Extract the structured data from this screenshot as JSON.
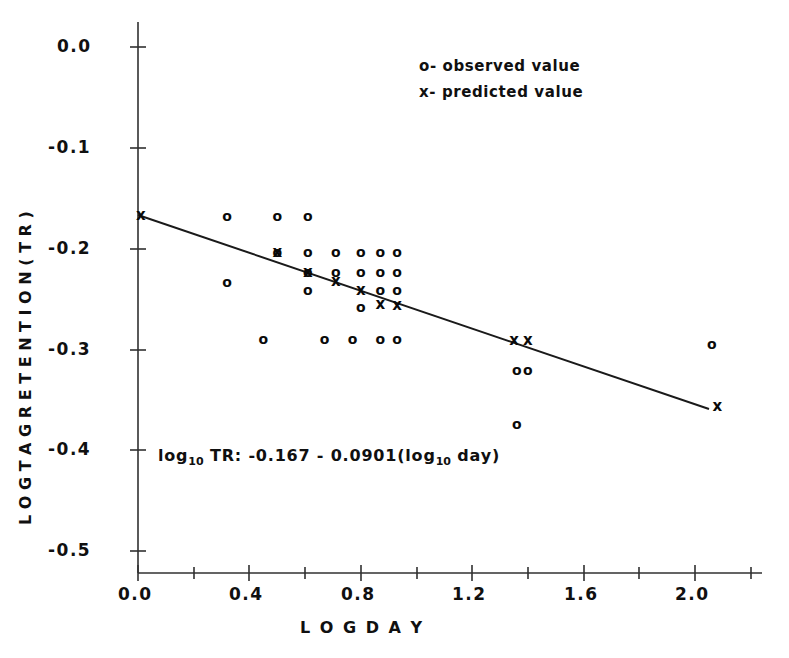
{
  "figure": {
    "width": 789,
    "height": 658,
    "background": "#ffffff",
    "ink_color": "#101010"
  },
  "axes": {
    "x_title": "L O G   D A Y",
    "y_title": "L O G  T A G  R E T E N T I O N ( T R )",
    "x_tick_labels": [
      "0.0",
      "0.4",
      "0.8",
      "1.2",
      "1.6",
      "2.0"
    ],
    "y_tick_labels": [
      "0.0",
      "-0.1",
      "-0.2",
      "-0.3",
      "-0.4",
      "-0.5"
    ]
  },
  "legend": {
    "observed": "o- observed  value",
    "predicted": "x- predicted  value"
  },
  "annotation": {
    "equation_prefix": "log",
    "equation_sub1": "10",
    "equation_mid": " TR: -0.167 - 0.0901(log",
    "equation_sub2": "10",
    "equation_suffix": " day)"
  },
  "chart_data": {
    "type": "scatter",
    "title": "",
    "xlabel": "LOG DAY",
    "ylabel": "LOG TAG RETENTION (TR)",
    "xlim": [
      0.0,
      2.2
    ],
    "ylim": [
      -0.5,
      0.0
    ],
    "xticks": [
      0.0,
      0.4,
      0.8,
      1.2,
      1.6,
      2.0
    ],
    "xticks_minor": [
      0.2,
      0.6,
      1.0,
      1.4,
      1.8,
      2.2
    ],
    "yticks": [
      0.0,
      -0.1,
      -0.2,
      -0.3,
      -0.4,
      -0.5
    ],
    "grid": false,
    "legend_position": "top-right",
    "regression": {
      "equation": "log10 TR = -0.167 - 0.0901 (log10 day)",
      "intercept": -0.167,
      "slope": -0.0901,
      "x_start": 0.0,
      "x_end": 2.08
    },
    "series": [
      {
        "name": "observed value",
        "marker": "o",
        "points": [
          [
            0.32,
            -0.168
          ],
          [
            0.5,
            -0.168
          ],
          [
            0.61,
            -0.168
          ],
          [
            0.5,
            -0.203
          ],
          [
            0.61,
            -0.203
          ],
          [
            0.71,
            -0.203
          ],
          [
            0.8,
            -0.203
          ],
          [
            0.87,
            -0.203
          ],
          [
            0.93,
            -0.203
          ],
          [
            0.61,
            -0.223
          ],
          [
            0.71,
            -0.223
          ],
          [
            0.8,
            -0.223
          ],
          [
            0.87,
            -0.223
          ],
          [
            0.93,
            -0.223
          ],
          [
            0.32,
            -0.233
          ],
          [
            0.61,
            -0.241
          ],
          [
            0.87,
            -0.241
          ],
          [
            0.93,
            -0.241
          ],
          [
            0.8,
            -0.258
          ],
          [
            0.45,
            -0.29
          ],
          [
            0.67,
            -0.29
          ],
          [
            0.77,
            -0.29
          ],
          [
            0.87,
            -0.29
          ],
          [
            0.93,
            -0.29
          ],
          [
            1.36,
            -0.32
          ],
          [
            1.4,
            -0.32
          ],
          [
            1.36,
            -0.374
          ],
          [
            2.06,
            -0.295
          ]
        ]
      },
      {
        "name": "predicted value",
        "marker": "x",
        "points": [
          [
            0.01,
            -0.167
          ],
          [
            0.5,
            -0.203
          ],
          [
            0.61,
            -0.223
          ],
          [
            0.71,
            -0.232
          ],
          [
            0.8,
            -0.241
          ],
          [
            0.87,
            -0.255
          ],
          [
            0.93,
            -0.256
          ],
          [
            1.35,
            -0.291
          ],
          [
            1.4,
            -0.291
          ],
          [
            2.08,
            -0.356
          ]
        ]
      }
    ]
  }
}
